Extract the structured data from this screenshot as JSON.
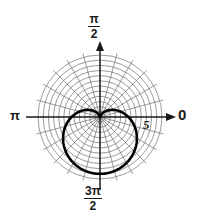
{
  "figure": {
    "title": "",
    "type": "polar-plot"
  },
  "labels": {
    "angle_zero": "0",
    "angle_pi": "π",
    "angle_pi_half_num": "π",
    "angle_pi_half_den": "2",
    "angle_3pi_half_num": "3π",
    "angle_3pi_half_den": "2",
    "radius_tick": "5"
  },
  "colors": {
    "curve": "#000000",
    "grid": "#7a7a7a",
    "axis": "#1a1a1a",
    "background": "#ffffff",
    "text": "#1a1a1a"
  },
  "chart_data": {
    "type": "line",
    "coordinate_system": "polar",
    "title": "",
    "xlabel": "",
    "ylabel": "",
    "grid": true,
    "legend": null,
    "center_px": [
      100,
      117
    ],
    "outer_radius_px": 62,
    "radial_rings": 12,
    "angular_spokes": 24,
    "spoke_step_deg": 15,
    "angle_tick_labels": [
      "0",
      "π/2",
      "π",
      "3π/2"
    ],
    "angle_tick_values_deg": [
      0,
      90,
      180,
      270
    ],
    "radial_tick_labels": [
      "5"
    ],
    "radial_tick_values": [
      5
    ],
    "rlim": [
      0,
      6
    ],
    "series": [
      {
        "name": "cardioid",
        "equation": "r = a(1 - sin(theta))",
        "a": 2.75,
        "description": "cardioid with cusp at the origin, opening upward",
        "theta_deg": [
          270,
          280,
          290,
          300,
          310,
          320,
          330,
          340,
          350,
          0,
          10,
          20,
          30,
          40,
          50,
          60,
          70,
          80,
          90,
          100,
          110,
          120,
          130,
          140,
          150,
          160,
          170,
          180,
          190,
          200,
          210,
          220,
          230,
          240,
          250,
          260,
          270
        ],
        "r": [
          5.5,
          5.46,
          5.33,
          5.13,
          4.85,
          4.51,
          4.12,
          3.69,
          3.23,
          2.75,
          2.27,
          1.81,
          1.38,
          0.98,
          0.64,
          0.37,
          0.17,
          0.04,
          0.0,
          0.04,
          0.17,
          0.37,
          0.64,
          0.98,
          1.38,
          1.81,
          2.27,
          2.75,
          3.23,
          3.69,
          4.12,
          4.51,
          4.85,
          5.13,
          5.33,
          5.46,
          5.5
        ]
      }
    ]
  }
}
